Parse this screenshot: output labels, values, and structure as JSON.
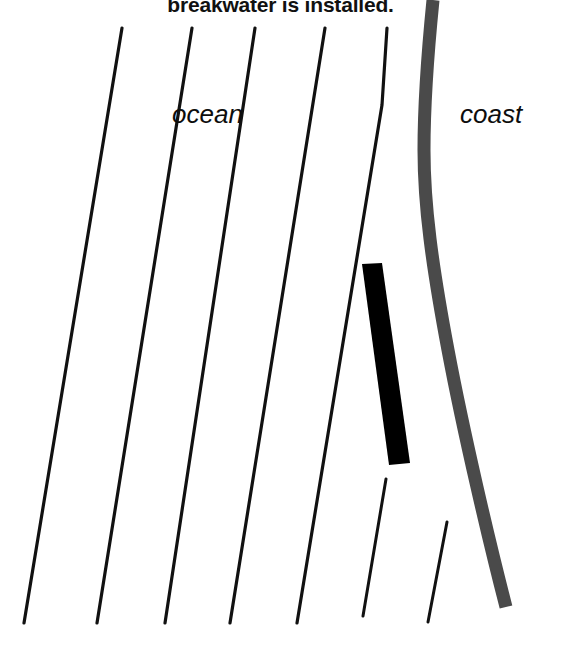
{
  "figure": {
    "caption": "breakwater is installed.",
    "labels": {
      "ocean": "ocean",
      "coast": "coast"
    },
    "colors": {
      "background": "#ffffff",
      "wave_line": "#111111",
      "coastline": "#4a4a4a",
      "breakwater": "#000000",
      "text": "#111111"
    }
  },
  "chart_data": {
    "type": "diagram",
    "title": "breakwater is installed.",
    "annotations": [
      "ocean",
      "coast"
    ],
    "elements": {
      "wave_crest_lines": [
        {
          "name": "wave-crest-1",
          "x1": 122,
          "y1": 28,
          "x2": 24,
          "y2": 623,
          "width": 3.2
        },
        {
          "name": "wave-crest-2",
          "x1": 192,
          "y1": 28,
          "x2": 97,
          "y2": 623,
          "width": 3.2
        },
        {
          "name": "wave-crest-3",
          "x1": 255,
          "y1": 28,
          "x2": 165,
          "y2": 623,
          "width": 3.2
        },
        {
          "name": "wave-crest-4",
          "x1": 325,
          "y1": 28,
          "x2": 230,
          "y2": 623,
          "width": 3.2
        },
        {
          "name": "wave-crest-5",
          "x1": 387,
          "y1": 28,
          "x2": 297,
          "y2": 623,
          "width": 3.2
        }
      ],
      "diffracted_wave_lines": [
        {
          "name": "diffracted-wave-1",
          "x1": 386,
          "y1": 479,
          "x2": 363,
          "y2": 616,
          "width": 3.0
        },
        {
          "name": "diffracted-wave-2",
          "x1": 447,
          "y1": 522,
          "x2": 428,
          "y2": 622,
          "width": 3.0
        }
      ],
      "coastline": {
        "name": "coastline-band",
        "points": [
          [
            433,
            0
          ],
          [
            428,
            60
          ],
          [
            424,
            130
          ],
          [
            424,
            180
          ],
          [
            430,
            260
          ],
          [
            445,
            345
          ],
          [
            470,
            455
          ],
          [
            495,
            560
          ],
          [
            506,
            607
          ]
        ],
        "width": 13,
        "color": "#4a4a4a"
      },
      "breakwater": {
        "name": "breakwater-structure",
        "polygon": [
          [
            362,
            264
          ],
          [
            382,
            263
          ],
          [
            410,
            463
          ],
          [
            389,
            465
          ]
        ],
        "color": "#000000"
      }
    },
    "xlim": [
      0,
      561
    ],
    "ylim": [
      0,
      659
    ],
    "grid": false,
    "legend": "none"
  }
}
